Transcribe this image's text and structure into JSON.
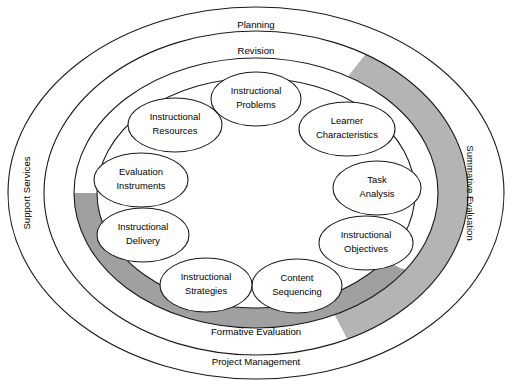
{
  "diagram": {
    "type": "concentric-ellipse-process-model",
    "background_color": "#ffffff",
    "line_color": "#1a1a1a",
    "gray_band_color": "#b4b4b4",
    "gray_band_dark_color": "#a0a0a0"
  },
  "rings": {
    "outer": {
      "name": "outer-ring",
      "labels": {
        "top": "Planning",
        "left": "Support Services",
        "bottom": "Project Management"
      }
    },
    "middle": {
      "name": "middle-ring",
      "labels": {
        "top": "Revision",
        "right": "Summative Evaluation"
      },
      "band_filled": true
    },
    "inner": {
      "name": "inner-ring",
      "labels": {
        "bottom": "Formative Evaluation"
      },
      "band_filled": true
    }
  },
  "core_elements": [
    {
      "id": "instructional-problems",
      "label_line1": "Instructional",
      "label_line2": "Problems",
      "angle_deg": 270
    },
    {
      "id": "learner-characteristics",
      "label_line1": "Learner",
      "label_line2": "Characteristics",
      "angle_deg": 310
    },
    {
      "id": "task-analysis",
      "label_line1": "Task",
      "label_line2": "Analysis",
      "angle_deg": 350
    },
    {
      "id": "instructional-objectives",
      "label_line1": "Instructional",
      "label_line2": "Objectives",
      "angle_deg": 30
    },
    {
      "id": "content-sequencing",
      "label_line1": "Content",
      "label_line2": "Sequencing",
      "angle_deg": 70
    },
    {
      "id": "instructional-strategies",
      "label_line1": "Instructional",
      "label_line2": "Strategies",
      "angle_deg": 110
    },
    {
      "id": "instructional-delivery",
      "label_line1": "Instructional",
      "label_line2": "Delivery",
      "angle_deg": 150
    },
    {
      "id": "evaluation-instruments",
      "label_line1": "Evaluation",
      "label_line2": "Instruments",
      "angle_deg": 190
    },
    {
      "id": "instructional-resources",
      "label_line1": "Instructional",
      "label_line2": "Resources",
      "angle_deg": 230
    }
  ]
}
